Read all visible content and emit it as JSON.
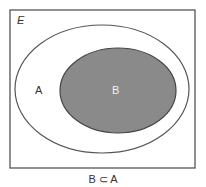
{
  "diagram": {
    "type": "venn",
    "universe_label": "E",
    "sets": [
      {
        "name": "A",
        "label": "A"
      },
      {
        "name": "B",
        "label": "B",
        "subset_of": "A"
      }
    ],
    "caption": "B ⊂ A",
    "colors": {
      "border": "#555555",
      "set_b_fill": "#8a8a8a",
      "background": "#ffffff"
    }
  }
}
